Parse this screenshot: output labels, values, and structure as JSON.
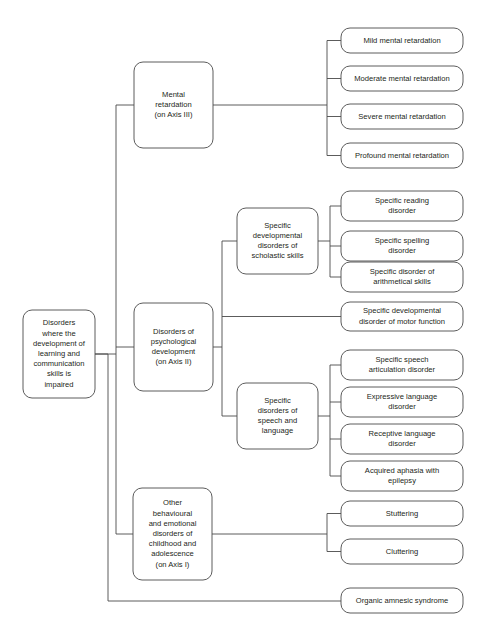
{
  "diagram": {
    "type": "hierarchical-flowchart",
    "orientation": "left-to-right",
    "colors": {
      "background": "#ffffff",
      "node_stroke": "#4a4a4a",
      "node_fill": "#ffffff",
      "connector": "#4a4a4a",
      "text": "#231f20"
    },
    "nodes": {
      "root": {
        "id": "root",
        "lines": [
          "Disorders",
          "where the",
          "development of",
          "learning and",
          "communication",
          "skills is",
          "impaired"
        ],
        "level": 0
      },
      "mental_retardation": {
        "id": "mental-retardation",
        "lines": [
          "Mental",
          "retardation",
          "(on Axis III)"
        ],
        "level": 1
      },
      "psychological_development": {
        "id": "disorders-of-psychological-development",
        "lines": [
          "Disorders of",
          "psychological",
          "development",
          "(on Axis II)"
        ],
        "level": 1
      },
      "other_behavioural": {
        "id": "other-behavioural-and-emotional-disorders",
        "lines": [
          "Other",
          "behavioural",
          "and emotional",
          "disorders of",
          "childhood and",
          "adolescence",
          "(on Axis I)"
        ],
        "level": 1
      },
      "organic_amnesic": {
        "id": "organic-amnesic-syndrome",
        "lines": [
          "Organic amnesic syndrome"
        ],
        "level": 1
      },
      "mild_mr": {
        "id": "mild-mental-retardation",
        "lines": [
          "Mild mental retardation"
        ],
        "level": 2
      },
      "moderate_mr": {
        "id": "moderate-mental-retardation",
        "lines": [
          "Moderate mental retardation"
        ],
        "level": 2
      },
      "severe_mr": {
        "id": "severe-mental-retardation",
        "lines": [
          "Severe mental retardation"
        ],
        "level": 2
      },
      "profound_mr": {
        "id": "profound-mental-retardation",
        "lines": [
          "Profound mental retardation"
        ],
        "level": 2
      },
      "scholastic_skills": {
        "id": "specific-developmental-disorders-of-scholastic-skills",
        "lines": [
          "Specific",
          "developmental",
          "disorders of",
          "scholastic skills"
        ],
        "level": 2
      },
      "motor_function": {
        "id": "specific-developmental-disorder-of-motor-function",
        "lines": [
          "Specific developmental",
          "disorder of motor function"
        ],
        "level": 2
      },
      "speech_language": {
        "id": "specific-disorders-of-speech-and-language",
        "lines": [
          "Specific",
          "disorders of",
          "speech and",
          "language"
        ],
        "level": 2
      },
      "reading_disorder": {
        "id": "specific-reading-disorder",
        "lines": [
          "Specific reading",
          "disorder"
        ],
        "level": 3
      },
      "spelling_disorder": {
        "id": "specific-spelling-disorder",
        "lines": [
          "Specific spelling",
          "disorder"
        ],
        "level": 3
      },
      "arithmetical_disorder": {
        "id": "specific-disorder-of-arithmetical-skills",
        "lines": [
          "Specific disorder of",
          "arithmetical skills"
        ],
        "level": 3
      },
      "speech_articulation": {
        "id": "specific-speech-articulation-disorder",
        "lines": [
          "Specific speech",
          "articulation disorder"
        ],
        "level": 3
      },
      "expressive_language": {
        "id": "expressive-language-disorder",
        "lines": [
          "Expressive language",
          "disorder"
        ],
        "level": 3
      },
      "receptive_language": {
        "id": "receptive-language-disorder",
        "lines": [
          "Receptive language",
          "disorder"
        ],
        "level": 3
      },
      "acquired_aphasia": {
        "id": "acquired-aphasia-with-epilepsy",
        "lines": [
          "Acquired aphasia with",
          "epilepsy"
        ],
        "level": 3
      },
      "stuttering": {
        "id": "stuttering",
        "lines": [
          "Stuttering"
        ],
        "level": 2
      },
      "cluttering": {
        "id": "cluttering",
        "lines": [
          "Cluttering"
        ],
        "level": 2
      }
    },
    "edges": [
      {
        "from": "root",
        "to": "mental_retardation"
      },
      {
        "from": "root",
        "to": "psychological_development"
      },
      {
        "from": "root",
        "to": "other_behavioural"
      },
      {
        "from": "root",
        "to": "organic_amnesic"
      },
      {
        "from": "mental_retardation",
        "to": "mild_mr"
      },
      {
        "from": "mental_retardation",
        "to": "moderate_mr"
      },
      {
        "from": "mental_retardation",
        "to": "severe_mr"
      },
      {
        "from": "mental_retardation",
        "to": "profound_mr"
      },
      {
        "from": "psychological_development",
        "to": "scholastic_skills"
      },
      {
        "from": "psychological_development",
        "to": "motor_function"
      },
      {
        "from": "psychological_development",
        "to": "speech_language"
      },
      {
        "from": "scholastic_skills",
        "to": "reading_disorder"
      },
      {
        "from": "scholastic_skills",
        "to": "spelling_disorder"
      },
      {
        "from": "scholastic_skills",
        "to": "arithmetical_disorder"
      },
      {
        "from": "speech_language",
        "to": "speech_articulation"
      },
      {
        "from": "speech_language",
        "to": "expressive_language"
      },
      {
        "from": "speech_language",
        "to": "receptive_language"
      },
      {
        "from": "speech_language",
        "to": "acquired_aphasia"
      },
      {
        "from": "other_behavioural",
        "to": "stuttering"
      },
      {
        "from": "other_behavioural",
        "to": "cluttering"
      }
    ]
  },
  "layout": {
    "boxes": {
      "root": {
        "x": 23,
        "y": 310,
        "w": 72,
        "h": 88,
        "r": 9
      },
      "mental_retardation": {
        "x": 134,
        "y": 62,
        "w": 79,
        "h": 86,
        "r": 9
      },
      "psychological_development": {
        "x": 134,
        "y": 303,
        "w": 79,
        "h": 88,
        "r": 9
      },
      "other_behavioural": {
        "x": 133,
        "y": 488,
        "w": 79,
        "h": 92,
        "r": 9
      },
      "organic_amnesic": {
        "x": 341,
        "y": 588,
        "w": 122,
        "h": 25,
        "r": 9
      },
      "mild_mr": {
        "x": 341,
        "y": 28,
        "w": 122,
        "h": 25,
        "r": 9
      },
      "moderate_mr": {
        "x": 341,
        "y": 66,
        "w": 122,
        "h": 25,
        "r": 9
      },
      "severe_mr": {
        "x": 341,
        "y": 104,
        "w": 122,
        "h": 25,
        "r": 9
      },
      "profound_mr": {
        "x": 341,
        "y": 143,
        "w": 122,
        "h": 25,
        "r": 9
      },
      "scholastic_skills": {
        "x": 237,
        "y": 208,
        "w": 81,
        "h": 66,
        "r": 9
      },
      "motor_function": {
        "x": 341,
        "y": 302,
        "w": 122,
        "h": 29,
        "r": 9
      },
      "speech_language": {
        "x": 237,
        "y": 383,
        "w": 81,
        "h": 66,
        "r": 9
      },
      "reading_disorder": {
        "x": 341,
        "y": 191,
        "w": 122,
        "h": 30,
        "r": 9
      },
      "spelling_disorder": {
        "x": 341,
        "y": 231,
        "w": 122,
        "h": 30,
        "r": 9
      },
      "arithmetical_disorder": {
        "x": 341,
        "y": 262,
        "w": 122,
        "h": 30,
        "r": 9
      },
      "speech_articulation": {
        "x": 341,
        "y": 350,
        "w": 122,
        "h": 30,
        "r": 9
      },
      "expressive_language": {
        "x": 341,
        "y": 387,
        "w": 122,
        "h": 30,
        "r": 9
      },
      "receptive_language": {
        "x": 341,
        "y": 424,
        "w": 122,
        "h": 30,
        "r": 9
      },
      "acquired_aphasia": {
        "x": 341,
        "y": 461,
        "w": 122,
        "h": 30,
        "r": 9
      },
      "stuttering": {
        "x": 341,
        "y": 501,
        "w": 122,
        "h": 25,
        "r": 9
      },
      "cluttering": {
        "x": 341,
        "y": 539,
        "w": 122,
        "h": 25,
        "r": 9
      }
    },
    "trunks": {
      "root_trunk_x": 116,
      "root_outer_trunk_x": 108,
      "root_bottom_y": 601,
      "mental_trunk_x": 327,
      "psych_trunk_x": 222,
      "scholastic_trunk_x": 330,
      "speech_trunk_x": 330,
      "other_trunk_x": 327
    }
  }
}
